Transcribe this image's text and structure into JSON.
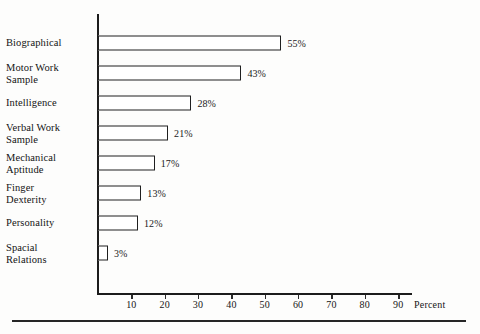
{
  "chart_data": {
    "type": "bar",
    "orientation": "horizontal",
    "title": "",
    "subtitle": "",
    "xlabel": "Percent",
    "ylabel": "",
    "xlim": [
      0,
      95
    ],
    "grid": false,
    "legend": null,
    "xticks": [
      10,
      20,
      30,
      40,
      50,
      60,
      70,
      80,
      90
    ],
    "xtick_labels": [
      "10",
      "20",
      "30",
      "40",
      "50",
      "60",
      "70",
      "80",
      "90"
    ],
    "categories": [
      "Biographical",
      "Motor Work Sample",
      "Intelligence",
      "Verbal Work Sample",
      "Mechanical Aptitude",
      "Finger Dexterity",
      "Personality",
      "Spacial Relations"
    ],
    "values": [
      55,
      43,
      28,
      21,
      17,
      13,
      12,
      3
    ],
    "value_labels": [
      "55%",
      "43%",
      "28%",
      "21%",
      "17%",
      "13%",
      "12%",
      "3%"
    ],
    "bar_fill_color": "#ffffff",
    "bar_edge_color": "#1f1f1f",
    "axis_color": "#1c1c1c",
    "background_color": "#fdfdfc"
  },
  "rows": [
    {
      "label_lines": [
        "Biographical"
      ],
      "value_label": "55%",
      "value": 55
    },
    {
      "label_lines": [
        "Motor Work",
        "Sample"
      ],
      "value_label": "43%",
      "value": 43
    },
    {
      "label_lines": [
        "Intelligence"
      ],
      "value_label": "28%",
      "value": 28
    },
    {
      "label_lines": [
        "Verbal Work",
        "Sample"
      ],
      "value_label": "21%",
      "value": 21
    },
    {
      "label_lines": [
        "Mechanical",
        "Aptitude"
      ],
      "value_label": "17%",
      "value": 17
    },
    {
      "label_lines": [
        "Finger",
        "Dexterity"
      ],
      "value_label": "13%",
      "value": 13
    },
    {
      "label_lines": [
        "Personality"
      ],
      "value_label": "12%",
      "value": 12
    },
    {
      "label_lines": [
        "Spacial",
        "Relations"
      ],
      "value_label": "3%",
      "value": 3
    }
  ],
  "axis": {
    "x_title": "Percent",
    "tick_labels": [
      "10",
      "20",
      "30",
      "40",
      "50",
      "60",
      "70",
      "80",
      "90"
    ]
  }
}
